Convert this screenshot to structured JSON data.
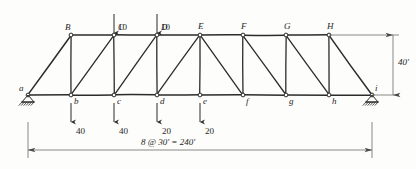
{
  "figure": {
    "kind": "truss-free-body-diagram",
    "title": "",
    "ink_color": "#2b2b2b",
    "paper_color": "#fdfdfb"
  },
  "geometry": {
    "panels": 8,
    "panel_length": "30'",
    "span": "240'",
    "height": "40'",
    "left_x": 28,
    "right_x": 372,
    "top_y": 35,
    "bottom_y": 95
  },
  "bottom_nodes": [
    {
      "id": "a",
      "label": "a",
      "x": 28,
      "y": 95,
      "label_dx": -9,
      "label_dy": -11
    },
    {
      "id": "b",
      "label": "b",
      "x": 71,
      "y": 95,
      "label_dx": 3,
      "label_dy": 2
    },
    {
      "id": "c",
      "label": "c",
      "x": 114,
      "y": 95,
      "label_dx": 3,
      "label_dy": 2
    },
    {
      "id": "d",
      "label": "d",
      "x": 157,
      "y": 95,
      "label_dx": 3,
      "label_dy": 2
    },
    {
      "id": "e",
      "label": "e",
      "x": 200,
      "y": 95,
      "label_dx": 3,
      "label_dy": 2
    },
    {
      "id": "f",
      "label": "f",
      "x": 243,
      "y": 95,
      "label_dx": 3,
      "label_dy": 2
    },
    {
      "id": "g",
      "label": "g",
      "x": 286,
      "y": 95,
      "label_dx": 3,
      "label_dy": 2
    },
    {
      "id": "h",
      "label": "h",
      "x": 329,
      "y": 95,
      "label_dx": 3,
      "label_dy": 2
    },
    {
      "id": "i",
      "label": "i",
      "x": 372,
      "y": 95,
      "label_dx": 3,
      "label_dy": -11
    }
  ],
  "top_nodes": [
    {
      "id": "B",
      "label": "B",
      "x": 71,
      "y": 35,
      "label_dx": -6,
      "label_dy": -12
    },
    {
      "id": "C",
      "label": "C",
      "x": 114,
      "y": 35,
      "label_dx": 4,
      "label_dy": -12
    },
    {
      "id": "D",
      "label": "D",
      "x": 157,
      "y": 35,
      "label_dx": 4,
      "label_dy": -12
    },
    {
      "id": "E",
      "label": "E",
      "x": 200,
      "y": 35,
      "label_dx": -2,
      "label_dy": -13
    },
    {
      "id": "F",
      "label": "F",
      "x": 243,
      "y": 35,
      "label_dx": -2,
      "label_dy": -13
    },
    {
      "id": "G",
      "label": "G",
      "x": 286,
      "y": 35,
      "label_dx": -2,
      "label_dy": -13
    },
    {
      "id": "H",
      "label": "H",
      "x": 329,
      "y": 35,
      "label_dx": -2,
      "label_dy": -13
    }
  ],
  "members": {
    "bottom_chord": [
      [
        "a",
        "b"
      ],
      [
        "b",
        "c"
      ],
      [
        "c",
        "d"
      ],
      [
        "d",
        "e"
      ],
      [
        "e",
        "f"
      ],
      [
        "f",
        "g"
      ],
      [
        "g",
        "h"
      ],
      [
        "h",
        "i"
      ]
    ],
    "top_chord": [
      [
        "B",
        "C"
      ],
      [
        "C",
        "D"
      ],
      [
        "D",
        "E"
      ],
      [
        "E",
        "F"
      ],
      [
        "F",
        "G"
      ],
      [
        "G",
        "H"
      ]
    ],
    "end_diagonals": [
      [
        "a",
        "B"
      ],
      [
        "H",
        "i"
      ]
    ],
    "verticals": [
      [
        "b",
        "B"
      ],
      [
        "c",
        "C"
      ],
      [
        "d",
        "D"
      ],
      [
        "e",
        "E"
      ],
      [
        "f",
        "F"
      ],
      [
        "g",
        "G"
      ],
      [
        "h",
        "H"
      ]
    ],
    "web_diagonals": [
      [
        "b",
        "C"
      ],
      [
        "c",
        "D"
      ],
      [
        "d",
        "E"
      ],
      [
        "E",
        "f"
      ],
      [
        "F",
        "g"
      ],
      [
        "G",
        "h"
      ]
    ]
  },
  "loads": {
    "top": [
      {
        "node": "C",
        "value": "10",
        "x": 114,
        "tail_y": 14,
        "head_y": 33,
        "label_dx": 4,
        "label_dy": -2
      },
      {
        "node": "D",
        "value": "10",
        "x": 157,
        "tail_y": 14,
        "head_y": 33,
        "label_dx": 4,
        "label_dy": -2
      }
    ],
    "bottom": [
      {
        "node": "b",
        "value": "40",
        "x": 71,
        "tail_y": 103,
        "head_y": 122,
        "label_dx": 5,
        "label_dy": 13
      },
      {
        "node": "c",
        "value": "40",
        "x": 114,
        "tail_y": 103,
        "head_y": 122,
        "label_dx": 5,
        "label_dy": 13
      },
      {
        "node": "d",
        "value": "20",
        "x": 157,
        "tail_y": 103,
        "head_y": 122,
        "label_dx": 5,
        "label_dy": 13
      },
      {
        "node": "e",
        "value": "20",
        "x": 200,
        "tail_y": 103,
        "head_y": 122,
        "label_dx": 5,
        "label_dy": 13
      }
    ]
  },
  "supports": [
    {
      "node": "a",
      "type": "pin-hatched",
      "x": 28,
      "y": 95
    },
    {
      "node": "i",
      "type": "pin-hatched",
      "x": 372,
      "y": 95
    }
  ],
  "dimensions": {
    "span": {
      "text": "8 @ 30' = 240'",
      "y": 150,
      "x1": 28,
      "x2": 372,
      "label_x": 168,
      "label_y": 138
    },
    "height": {
      "text": "40'",
      "x": 393,
      "y1": 35,
      "y2": 95,
      "label_x": 398,
      "label_y": 58
    }
  }
}
